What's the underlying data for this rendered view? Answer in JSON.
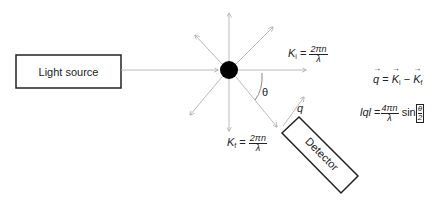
{
  "diagram": {
    "light_source": {
      "label": "Light source"
    },
    "particle": {
      "shape": "filled-circle",
      "color": "#000000"
    },
    "scattered_rays": [
      "up",
      "up-left",
      "up-right",
      "right",
      "down",
      "down-left",
      "down-right"
    ],
    "incident_wavevector": {
      "symbol": "K",
      "subscript": "i",
      "equals": "=",
      "numerator": "2πn",
      "denominator": "λ"
    },
    "scattered_wavevector": {
      "symbol": "K",
      "subscript": "f",
      "equals": "=",
      "numerator": "2πn",
      "denominator": "λ"
    },
    "angle_label": "θ",
    "scattering_vector_label": "q",
    "detector": {
      "label": "Detector"
    },
    "equations": {
      "vector_eq": {
        "lhs": "q",
        "equals": "=",
        "term1": "K",
        "term1_sub": "i",
        "minus": "−",
        "term2": "K",
        "term2_sub": "f"
      },
      "magnitude_eq": {
        "lhs": "lql",
        "equals": "=",
        "numerator": "4πn",
        "denominator": "λ",
        "func": "sin",
        "arg_numerator": "θ",
        "arg_denominator": "2"
      }
    },
    "colors": {
      "lines": "#bbbbbb",
      "box_border": "#222222",
      "text": "#222222"
    }
  }
}
